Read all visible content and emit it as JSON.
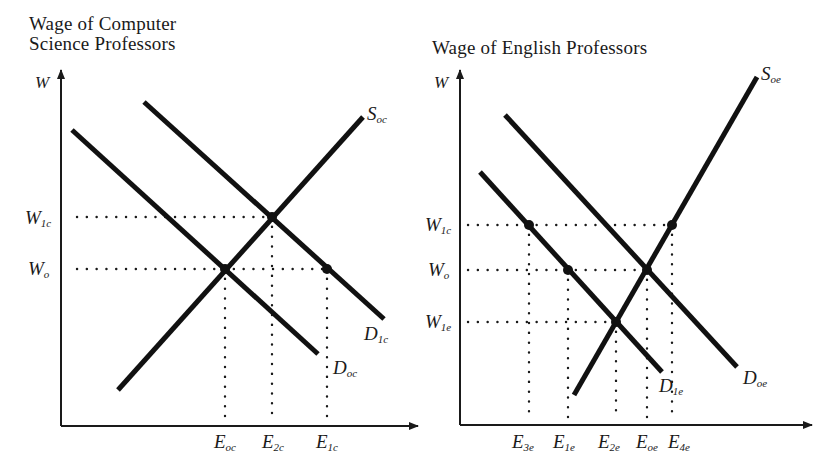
{
  "left_panel": {
    "title_line1": "Wage of Computer",
    "title_line2": "Science Professors",
    "y_axis": "W",
    "wage_labels": [
      {
        "main": "W",
        "sub": "1c"
      },
      {
        "main": "W",
        "sub": "o"
      }
    ],
    "curves": {
      "supply": {
        "main": "S",
        "sub": "oc"
      },
      "demand_original": {
        "main": "D",
        "sub": "oc"
      },
      "demand_new": {
        "main": "D",
        "sub": "1c"
      }
    },
    "employment_labels": [
      {
        "main": "E",
        "sub": "oc"
      },
      {
        "main": "E",
        "sub": "2c"
      },
      {
        "main": "E",
        "sub": "1c"
      }
    ]
  },
  "right_panel": {
    "title": "Wage of English Professors",
    "y_axis": "W",
    "wage_labels": [
      {
        "main": "W",
        "sub": "1c"
      },
      {
        "main": "W",
        "sub": "o"
      },
      {
        "main": "W",
        "sub": "1e"
      }
    ],
    "curves": {
      "supply": {
        "main": "S",
        "sub": "oe"
      },
      "demand_original": {
        "main": "D",
        "sub": "oe"
      },
      "demand_new": {
        "main": "D",
        "sub": "1e"
      }
    },
    "employment_labels": [
      {
        "main": "E",
        "sub": "3e"
      },
      {
        "main": "E",
        "sub": "1e"
      },
      {
        "main": "E",
        "sub": "2e"
      },
      {
        "main": "E",
        "sub": "oe"
      },
      {
        "main": "E",
        "sub": "4e"
      }
    ]
  }
}
